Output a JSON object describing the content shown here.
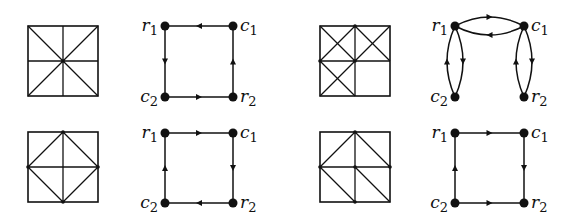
{
  "colors": {
    "ink": "#111111",
    "background": "#ffffff"
  },
  "panels": [
    {
      "id": "panel-top-left",
      "grid": {
        "x": 28,
        "y": 26,
        "size": 70,
        "description": "square divided into 2x2 by midlines, with both full diagonals; dot at center",
        "lines": [
          [
            0.5,
            0,
            0.5,
            1
          ],
          [
            0,
            0.5,
            1,
            0.5
          ],
          [
            0,
            0,
            1,
            1
          ],
          [
            1,
            0,
            0,
            1
          ]
        ],
        "dots": [
          [
            0.5,
            0.5
          ]
        ]
      },
      "graph": {
        "nodes": {
          "r1": {
            "x": 165,
            "y": 26,
            "label": "r",
            "sub": "1",
            "label_side": "left"
          },
          "c1": {
            "x": 233,
            "y": 26,
            "label": "c",
            "sub": "1",
            "label_side": "right"
          },
          "c2": {
            "x": 165,
            "y": 97,
            "label": "c",
            "sub": "2",
            "label_side": "left"
          },
          "r2": {
            "x": 233,
            "y": 97,
            "label": "r",
            "sub": "2",
            "label_side": "right"
          }
        },
        "edges": [
          {
            "from": "c1",
            "to": "r1",
            "curve": 0
          },
          {
            "from": "r1",
            "to": "c2",
            "curve": 0
          },
          {
            "from": "c2",
            "to": "r2",
            "curve": 0
          },
          {
            "from": "r2",
            "to": "c1",
            "curve": 0
          }
        ]
      }
    },
    {
      "id": "panel-top-right",
      "grid": {
        "x": 320,
        "y": 26,
        "size": 70,
        "description": "2x2 square; X diagonals in top-left, top-right and bottom-left cells; bottom-right cell empty",
        "lines": [
          [
            0.5,
            0,
            0.5,
            1
          ],
          [
            0,
            0.5,
            1,
            0.5
          ],
          [
            0,
            0,
            0.5,
            0.5
          ],
          [
            0.5,
            0,
            0,
            0.5
          ],
          [
            0.5,
            0,
            1,
            0.5
          ],
          [
            1,
            0,
            0.5,
            0.5
          ],
          [
            0,
            0.5,
            0.5,
            1
          ],
          [
            0.5,
            0.5,
            0,
            1
          ]
        ],
        "dots": [
          [
            0.5,
            0.5
          ],
          [
            0.5,
            0
          ],
          [
            0,
            0.5
          ]
        ]
      },
      "graph": {
        "nodes": {
          "r1": {
            "x": 455,
            "y": 26,
            "label": "r",
            "sub": "1",
            "label_side": "left"
          },
          "c1": {
            "x": 524,
            "y": 26,
            "label": "c",
            "sub": "1",
            "label_side": "right"
          },
          "c2": {
            "x": 455,
            "y": 97,
            "label": "c",
            "sub": "2",
            "label_side": "left"
          },
          "r2": {
            "x": 524,
            "y": 97,
            "label": "r",
            "sub": "2",
            "label_side": "right"
          }
        },
        "edges": [
          {
            "from": "c1",
            "to": "r1",
            "curve": -9
          },
          {
            "from": "r1",
            "to": "c1",
            "curve": -9
          },
          {
            "from": "r1",
            "to": "c2",
            "curve": -8
          },
          {
            "from": "c2",
            "to": "r1",
            "curve": -8
          },
          {
            "from": "c1",
            "to": "r2",
            "curve": -8
          },
          {
            "from": "r2",
            "to": "c1",
            "curve": -8
          }
        ]
      }
    },
    {
      "id": "panel-bottom-left",
      "grid": {
        "x": 28,
        "y": 132,
        "size": 70,
        "description": "square with midlines and inscribed diamond connecting edge midpoints",
        "lines": [
          [
            0.5,
            0,
            0.5,
            1
          ],
          [
            0,
            0.5,
            1,
            0.5
          ],
          [
            0.5,
            0,
            1,
            0.5
          ],
          [
            1,
            0.5,
            0.5,
            1
          ],
          [
            0.5,
            1,
            0,
            0.5
          ],
          [
            0,
            0.5,
            0.5,
            0
          ]
        ],
        "dots": [
          [
            0.5,
            0
          ],
          [
            1,
            0.5
          ],
          [
            0.5,
            1
          ],
          [
            0,
            0.5
          ]
        ]
      },
      "graph": {
        "nodes": {
          "r1": {
            "x": 165,
            "y": 133,
            "label": "r",
            "sub": "1",
            "label_side": "left"
          },
          "c1": {
            "x": 233,
            "y": 133,
            "label": "c",
            "sub": "1",
            "label_side": "right"
          },
          "c2": {
            "x": 165,
            "y": 203,
            "label": "c",
            "sub": "2",
            "label_side": "left"
          },
          "r2": {
            "x": 233,
            "y": 203,
            "label": "r",
            "sub": "2",
            "label_side": "right"
          }
        },
        "edges": [
          {
            "from": "r1",
            "to": "c1",
            "curve": 0
          },
          {
            "from": "c1",
            "to": "r2",
            "curve": 0
          },
          {
            "from": "r2",
            "to": "c2",
            "curve": 0
          },
          {
            "from": "c2",
            "to": "r1",
            "curve": 0
          }
        ]
      }
    },
    {
      "id": "panel-bottom-right",
      "grid": {
        "x": 320,
        "y": 132,
        "size": 70,
        "description": "2x2 square; top half has peak lines from left-mid to top-mid to right-mid; bottom cells each have a diagonal from top-left to bottom-right",
        "lines": [
          [
            0.5,
            0,
            0.5,
            1
          ],
          [
            0,
            0.5,
            1,
            0.5
          ],
          [
            0,
            0.5,
            0.5,
            0
          ],
          [
            0.5,
            0,
            1,
            0.5
          ],
          [
            0,
            0.5,
            0.5,
            1
          ],
          [
            0.5,
            0.5,
            1,
            1
          ]
        ],
        "dots": [
          [
            0.5,
            0
          ],
          [
            0,
            0.5
          ],
          [
            0.5,
            0.5
          ],
          [
            1,
            0.5
          ],
          [
            0.5,
            1
          ]
        ]
      },
      "graph": {
        "nodes": {
          "r1": {
            "x": 455,
            "y": 133,
            "label": "r",
            "sub": "1",
            "label_side": "left"
          },
          "c1": {
            "x": 524,
            "y": 133,
            "label": "c",
            "sub": "1",
            "label_side": "right"
          },
          "c2": {
            "x": 455,
            "y": 203,
            "label": "c",
            "sub": "2",
            "label_side": "left"
          },
          "r2": {
            "x": 524,
            "y": 203,
            "label": "r",
            "sub": "2",
            "label_side": "right"
          }
        },
        "edges": [
          {
            "from": "r1",
            "to": "c1",
            "curve": 0
          },
          {
            "from": "c1",
            "to": "r2",
            "curve": 0
          },
          {
            "from": "c2",
            "to": "r2",
            "curve": 0
          },
          {
            "from": "c2",
            "to": "r1",
            "curve": 0
          }
        ]
      }
    }
  ]
}
